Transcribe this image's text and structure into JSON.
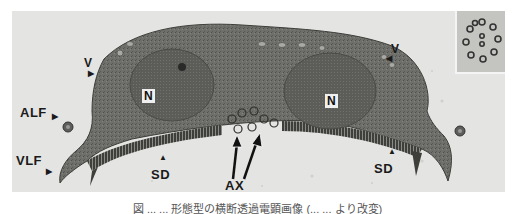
{
  "figure": {
    "type": "transmission-electron-micrograph",
    "labels": {
      "v_left": "V",
      "v_right": "V",
      "alf": "ALF",
      "vlf": "VLF",
      "n_left": "N",
      "n_right": "N",
      "sd_left": "SD",
      "sd_right": "SD",
      "ax": "AX"
    },
    "inset": {
      "description": "axoneme cross-section 9+2"
    },
    "colors": {
      "background": "#e4e4e2",
      "cell": "#6e6e6a",
      "nucleus": "#5a5a56",
      "label": "#1a1a1a"
    }
  },
  "caption": {
    "text": "図 ... ... 形態型の横断透過電顕画像 (... ... より改変)"
  }
}
